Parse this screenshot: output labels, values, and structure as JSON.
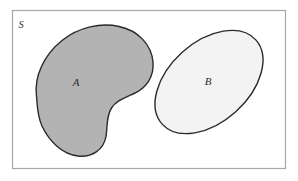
{
  "diagram": {
    "type": "venn-set-diagram",
    "background_color": "#ffffff",
    "universe": {
      "label": "S",
      "shape": "rectangle",
      "border_color": "#a6a6a6",
      "fill_color": "#ffffff",
      "border_width": 1,
      "x": 12,
      "y": 10,
      "width": 274,
      "height": 159,
      "label_x": 21,
      "label_y": 26
    },
    "sets": [
      {
        "label": "A",
        "shape": "kidney",
        "fill_color": "#b3b3b3",
        "stroke_color": "#2a2a2a",
        "stroke_width": 1.4,
        "label_x": 76,
        "label_y": 83,
        "shaded": true
      },
      {
        "label": "B",
        "shape": "ellipse",
        "fill_color": "#f3f3f3",
        "stroke_color": "#2a2a2a",
        "stroke_width": 1.4,
        "label_x": 208,
        "label_y": 82,
        "center_x": 209,
        "center_y": 82,
        "radius_x": 63,
        "radius_y": 40,
        "rotation_deg": -42,
        "shaded": false
      }
    ],
    "relationship": "disjoint"
  }
}
